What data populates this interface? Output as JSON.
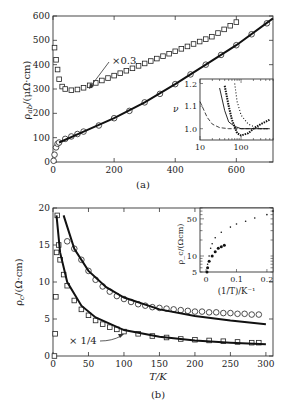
{
  "chart_data": [
    {
      "panel": "(a)",
      "type": "scatter",
      "xlabel": "",
      "ylabel": "ρ_ab/(μΩ·cm)",
      "ylabel_main": "ρ",
      "ylabel_sub": "ab",
      "ylabel_unit": "/(μΩ·cm)",
      "xlim": [
        0,
        720
      ],
      "ylim": [
        0,
        600
      ],
      "xticks": [
        "0",
        "200",
        "400",
        "600"
      ],
      "yticks": [
        "0",
        "100",
        "200",
        "300",
        "400",
        "500",
        "600"
      ],
      "annotation": "×0.3",
      "series": [
        {
          "name": "scaled ×0.3 (squares)",
          "marker": "square",
          "x": [
            5,
            10,
            15,
            20,
            30,
            40,
            60,
            80,
            100,
            120,
            140,
            160,
            180,
            200,
            220,
            240,
            260,
            280,
            300,
            320,
            340,
            360,
            380,
            400,
            420,
            440,
            460,
            480,
            500,
            520,
            540,
            560,
            580,
            600
          ],
          "y": [
            470,
            420,
            380,
            340,
            310,
            300,
            295,
            298,
            305,
            315,
            325,
            335,
            345,
            355,
            365,
            375,
            385,
            395,
            405,
            415,
            425,
            435,
            445,
            455,
            465,
            475,
            485,
            495,
            505,
            515,
            530,
            545,
            560,
            575
          ]
        },
        {
          "name": "raw (circles)",
          "marker": "circle",
          "x": [
            2,
            5,
            10,
            15,
            20,
            40,
            60,
            80,
            100,
            150,
            200,
            250,
            300,
            350,
            400,
            450,
            500,
            550,
            600,
            650,
            700
          ],
          "y": [
            5,
            30,
            60,
            75,
            80,
            95,
            105,
            115,
            125,
            150,
            180,
            210,
            245,
            280,
            320,
            360,
            400,
            440,
            480,
            525,
            570
          ]
        },
        {
          "name": "fit",
          "marker": "line",
          "x": [
            20,
            100,
            200,
            300,
            400,
            500,
            600,
            720
          ],
          "y": [
            80,
            125,
            180,
            245,
            320,
            400,
            480,
            590
          ]
        }
      ],
      "inset": {
        "type": "line",
        "xscale": "log",
        "xticks": [
          "10",
          "100"
        ],
        "yticks": [
          "1.0",
          "1.1",
          "1.2"
        ],
        "ylabel": "ν",
        "xlim": [
          10,
          600
        ],
        "ylim": [
          0.95,
          1.22
        ],
        "series": [
          {
            "name": "dashed",
            "style": "dashed",
            "x": [
              10,
              15,
              20,
              30,
              50,
              100,
              200,
              500
            ],
            "y": [
              1.12,
              1.05,
              1.02,
              1.005,
              1.0,
              1.0,
              1.0,
              1.0
            ]
          },
          {
            "name": "solid",
            "style": "solid",
            "x": [
              30,
              40,
              50,
              70,
              100,
              200,
              500
            ],
            "y": [
              1.18,
              1.08,
              1.03,
              1.01,
              1.0,
              1.0,
              1.0
            ]
          },
          {
            "name": "dotted",
            "style": "dotted",
            "x": [
              70,
              80,
              100,
              150,
              200,
              300,
              500
            ],
            "y": [
              1.2,
              1.12,
              1.06,
              1.02,
              1.01,
              1.0,
              1.0
            ]
          },
          {
            "name": "heavy dots",
            "style": "heavy-dotted",
            "x": [
              40,
              50,
              60,
              80,
              100,
              150,
              200,
              300,
              500
            ],
            "y": [
              1.19,
              1.1,
              1.04,
              0.98,
              0.97,
              0.98,
              1.0,
              1.02,
              1.04
            ]
          }
        ]
      },
      "caption": "(a)"
    },
    {
      "panel": "(b)",
      "type": "scatter",
      "xlabel": "T/K",
      "ylabel": "ρ_c/(Ω·cm)",
      "ylabel_main": "ρ",
      "ylabel_sub": "c",
      "ylabel_unit": "/(Ω·cm)",
      "xlim": [
        0,
        310
      ],
      "ylim": [
        0,
        20
      ],
      "xticks": [
        "0",
        "50",
        "100",
        "150",
        "200",
        "250",
        "300"
      ],
      "yticks": [
        "0",
        "5",
        "10",
        "15",
        "20"
      ],
      "annotation": "× 1/4",
      "series": [
        {
          "name": "circles",
          "marker": "circle",
          "x": [
            20,
            30,
            40,
            50,
            60,
            70,
            80,
            90,
            100,
            110,
            120,
            130,
            140,
            150,
            160,
            170,
            180,
            190,
            200,
            210,
            220,
            230,
            240,
            250,
            260,
            270,
            280,
            290
          ],
          "y": [
            15.5,
            14.5,
            13.0,
            11.5,
            10.3,
            9.4,
            8.7,
            8.1,
            7.7,
            7.3,
            7.0,
            6.8,
            6.6,
            6.5,
            6.4,
            6.3,
            6.2,
            6.1,
            6.0,
            6.0,
            5.9,
            5.9,
            5.8,
            5.8,
            5.7,
            5.7,
            5.6,
            5.6
          ]
        },
        {
          "name": "squares ×1/4",
          "marker": "square",
          "x": [
            2,
            3,
            4,
            5,
            6,
            8,
            10,
            15,
            20,
            30,
            40,
            50,
            60,
            70,
            80,
            90,
            100,
            120,
            140,
            160,
            180,
            200,
            220,
            240,
            260,
            280,
            290
          ],
          "y": [
            0,
            3,
            8,
            14,
            19,
            15,
            13,
            11,
            9.5,
            7.5,
            6.3,
            5.5,
            4.8,
            4.3,
            3.9,
            3.6,
            3.3,
            3.0,
            2.7,
            2.5,
            2.3,
            2.2,
            2.1,
            2.0,
            1.9,
            1.8,
            1.8
          ]
        },
        {
          "name": "fit upper",
          "marker": "line",
          "x": [
            15,
            30,
            50,
            75,
            100,
            150,
            200,
            250,
            300
          ],
          "y": [
            19,
            14.5,
            11.5,
            9.3,
            7.9,
            6.3,
            5.4,
            4.8,
            4.3
          ]
        },
        {
          "name": "fit lower",
          "marker": "line",
          "x": [
            5,
            10,
            20,
            40,
            60,
            100,
            150,
            200,
            250,
            300
          ],
          "y": [
            19,
            14,
            10,
            6.8,
            5.2,
            3.5,
            2.6,
            2.1,
            1.8,
            1.6
          ]
        }
      ],
      "inset": {
        "type": "scatter",
        "yscale": "log",
        "xlabel": "(1/T)/K⁻¹",
        "ylabel": "ρ_c/(Ωcm)",
        "xticks": [
          "0",
          "0.1",
          "0.2"
        ],
        "yticks": [
          "5",
          "10",
          "50"
        ],
        "xlim": [
          -0.02,
          0.22
        ],
        "ylim": [
          5,
          80
        ],
        "series": [
          {
            "name": "light dots",
            "x": [
              0.003,
              0.005,
              0.01,
              0.015,
              0.02,
              0.03,
              0.05,
              0.08,
              0.1,
              0.13,
              0.16,
              0.2,
              0.22
            ],
            "y": [
              5,
              7,
              10,
              14,
              17,
              22,
              28,
              35,
              40,
              45,
              52,
              60,
              70
            ]
          },
          {
            "name": "heavy dots",
            "x": [
              0.003,
              0.005,
              0.01,
              0.02,
              0.03,
              0.04,
              0.05,
              0.06
            ],
            "y": [
              5,
              6,
              8,
              10,
              12,
              14,
              15,
              16
            ]
          }
        ]
      },
      "caption": "(b)"
    }
  ]
}
